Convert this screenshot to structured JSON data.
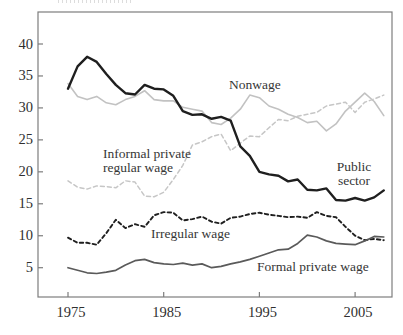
{
  "chart_data": {
    "type": "line",
    "title": "",
    "xlabel": "",
    "ylabel": "",
    "x": [
      1975,
      1976,
      1977,
      1978,
      1979,
      1980,
      1981,
      1982,
      1983,
      1984,
      1985,
      1986,
      1987,
      1988,
      1989,
      1990,
      1991,
      1992,
      1993,
      1994,
      1995,
      1996,
      1997,
      1998,
      1999,
      2000,
      2001,
      2002,
      2003,
      2004,
      2005,
      2006,
      2007,
      2008
    ],
    "x_ticks": [
      1975,
      1985,
      1995,
      2005
    ],
    "y_ticks": [
      5,
      10,
      15,
      20,
      25,
      30,
      35,
      40
    ],
    "ylim": [
      0,
      45
    ],
    "grid": false,
    "legend_position": "inline-annotations",
    "axis_color": "#7d7d7d",
    "tick_label_color": "#2f2f2f",
    "series": [
      {
        "name": "Nonwage",
        "color": "#c2c2c2",
        "style": "solid",
        "width": 1.6,
        "values": [
          33.8,
          31.8,
          31.3,
          31.8,
          30.8,
          30.5,
          31.3,
          31.8,
          32.7,
          31.3,
          31.1,
          31.1,
          30.1,
          29.8,
          29.5,
          27.7,
          27.4,
          28.4,
          29.8,
          32.0,
          31.6,
          30.3,
          29.8,
          29.0,
          28.5,
          27.7,
          27.9,
          26.4,
          27.5,
          29.5,
          30.9,
          32.3,
          31.0,
          28.8
        ]
      },
      {
        "name": "Informal private regular wage",
        "color": "#c6c6c6",
        "style": "dashed",
        "width": 1.5,
        "values": [
          18.6,
          17.6,
          17.3,
          17.8,
          17.7,
          17.5,
          18.6,
          18.4,
          16.2,
          16.1,
          16.8,
          18.8,
          21.0,
          24.2,
          24.7,
          25.5,
          25.9,
          23.3,
          24.5,
          25.6,
          25.5,
          26.9,
          28.2,
          28.0,
          28.7,
          29.0,
          29.3,
          30.3,
          30.6,
          30.9,
          29.3,
          30.9,
          31.4,
          32.0
        ]
      },
      {
        "name": "Public sector",
        "color": "#1f1f1f",
        "style": "solid",
        "width": 2.4,
        "values": [
          33.0,
          36.5,
          38.0,
          37.2,
          35.3,
          33.6,
          32.3,
          32.1,
          33.6,
          33.0,
          32.9,
          31.9,
          29.5,
          28.9,
          29.0,
          28.3,
          28.6,
          28.0,
          24.0,
          22.5,
          20.0,
          19.6,
          19.4,
          18.5,
          18.8,
          17.2,
          17.1,
          17.4,
          15.6,
          15.5,
          15.9,
          15.5,
          16.0,
          17.1
        ]
      },
      {
        "name": "Irregular wage",
        "color": "#1f1f1f",
        "style": "dashed",
        "width": 1.9,
        "values": [
          9.7,
          8.9,
          8.9,
          8.6,
          10.4,
          12.5,
          11.2,
          11.8,
          11.4,
          13.2,
          13.7,
          13.6,
          12.4,
          12.6,
          13.0,
          12.2,
          11.9,
          12.8,
          13.0,
          13.4,
          13.6,
          13.3,
          13.1,
          12.9,
          13.0,
          12.8,
          13.7,
          13.1,
          12.9,
          11.4,
          10.0,
          9.3,
          9.5,
          9.3
        ]
      },
      {
        "name": "Formal private wage",
        "color": "#5a5a5a",
        "style": "solid",
        "width": 1.7,
        "values": [
          5.0,
          4.6,
          4.2,
          4.1,
          4.3,
          4.6,
          5.4,
          6.1,
          6.3,
          5.8,
          5.6,
          5.5,
          5.7,
          5.4,
          5.6,
          5.0,
          5.2,
          5.6,
          5.9,
          6.3,
          6.8,
          7.3,
          7.8,
          7.9,
          8.8,
          10.1,
          9.8,
          9.2,
          8.8,
          8.7,
          8.6,
          9.2,
          9.9,
          9.8
        ]
      }
    ],
    "annotations": [
      {
        "id": "nonwage-label",
        "text": "Nonwage",
        "x": 229,
        "y": 78,
        "align": "left"
      },
      {
        "id": "informal-private-regular-wage-label",
        "text": "Informal private\nregular wage",
        "x": 103,
        "y": 147,
        "align": "left"
      },
      {
        "id": "public-sector-label",
        "text": "Public\nsector",
        "x": 354,
        "y": 160,
        "align": "center"
      },
      {
        "id": "irregular-wage-label",
        "text": "Irregular wage",
        "x": 151,
        "y": 227,
        "align": "left"
      },
      {
        "id": "formal-private-wage-label",
        "text": "Formal private wage",
        "x": 257,
        "y": 260,
        "align": "left"
      }
    ]
  }
}
